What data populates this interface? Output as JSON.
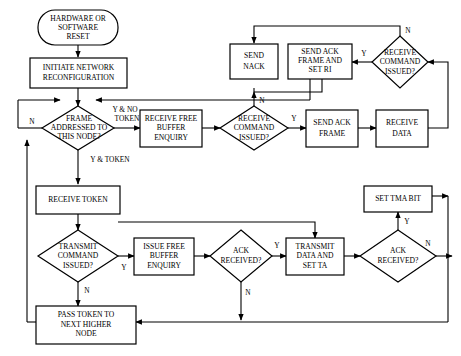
{
  "diagram": {
    "background_color": "#ffffff",
    "line_color": "#000000",
    "fill_color": "#ffffff",
    "nodes": [
      {
        "id": "reset",
        "shape": "rounded",
        "lines": [
          "HARDWARE OR",
          "SOFTWARE",
          "RESET"
        ]
      },
      {
        "id": "initiate",
        "shape": "rect",
        "lines": [
          "INITIATE NETWORK",
          "RECONFIGURATION"
        ]
      },
      {
        "id": "frame_addressed",
        "shape": "diamond",
        "lines": [
          "FRAME",
          "ADDRESSED TO",
          "THIS NODE?"
        ]
      },
      {
        "id": "recv_free_buffer",
        "shape": "rect",
        "lines": [
          "RECEIVE FREE",
          "BUFFER",
          "ENQUIRY"
        ]
      },
      {
        "id": "recv_cmd_issued_1",
        "shape": "diamond",
        "lines": [
          "RECEIVE",
          "COMMAND",
          "ISSUED?"
        ]
      },
      {
        "id": "send_ack_frame",
        "shape": "rect",
        "lines": [
          "SEND ACK",
          "FRAME"
        ]
      },
      {
        "id": "receive_data",
        "shape": "rect",
        "lines": [
          "RECEIVE",
          "DATA"
        ]
      },
      {
        "id": "send_nack",
        "shape": "rect",
        "lines": [
          "SEND",
          "NACK"
        ]
      },
      {
        "id": "send_ack_frame_ri",
        "shape": "rect",
        "lines": [
          "SEND ACK",
          "FRAME AND",
          "SET RI"
        ]
      },
      {
        "id": "recv_cmd_issued_2",
        "shape": "diamond",
        "lines": [
          "RECEIVE",
          "COMMAND",
          "ISSUED?"
        ]
      },
      {
        "id": "receive_token",
        "shape": "rect",
        "lines": [
          "RECEIVE TOKEN"
        ]
      },
      {
        "id": "transmit_cmd_issued",
        "shape": "diamond",
        "lines": [
          "TRANSMIT",
          "COMMAND",
          "ISSUED?"
        ]
      },
      {
        "id": "issue_free_buffer",
        "shape": "rect",
        "lines": [
          "ISSUE FREE",
          "BUFFER",
          "ENQUIRY"
        ]
      },
      {
        "id": "ack_received_1",
        "shape": "diamond",
        "lines": [
          "ACK",
          "RECEIVED?"
        ]
      },
      {
        "id": "transmit_data_ta",
        "shape": "rect",
        "lines": [
          "TRANSMIT",
          "DATA AND",
          "SET TA"
        ]
      },
      {
        "id": "ack_received_2",
        "shape": "diamond",
        "lines": [
          "ACK",
          "RECEIVED?"
        ]
      },
      {
        "id": "set_tma_bit",
        "shape": "rect",
        "lines": [
          "SET TMA BIT"
        ]
      },
      {
        "id": "pass_token",
        "shape": "rect",
        "lines": [
          "PASS TOKEN TO",
          "NEXT HIGHER",
          "NODE"
        ]
      }
    ],
    "edge_labels": [
      {
        "id": "frame_no",
        "text": "N"
      },
      {
        "id": "frame_yes_no_token_line1",
        "text": "Y & NO"
      },
      {
        "id": "frame_yes_no_token_line2",
        "text": "TOKEN"
      },
      {
        "id": "frame_yes_token",
        "text": "Y & TOKEN"
      },
      {
        "id": "recv_cmd_1_yes",
        "text": "Y"
      },
      {
        "id": "recv_cmd_1_no",
        "text": "N"
      },
      {
        "id": "recv_cmd_2_yes",
        "text": "Y"
      },
      {
        "id": "recv_cmd_2_no",
        "text": "N"
      },
      {
        "id": "transmit_cmd_yes",
        "text": "Y"
      },
      {
        "id": "transmit_cmd_no",
        "text": "N"
      },
      {
        "id": "ack_1_yes",
        "text": "Y"
      },
      {
        "id": "ack_1_no",
        "text": "N"
      },
      {
        "id": "ack_2_yes",
        "text": "Y"
      },
      {
        "id": "ack_2_no",
        "text": "N"
      }
    ]
  }
}
